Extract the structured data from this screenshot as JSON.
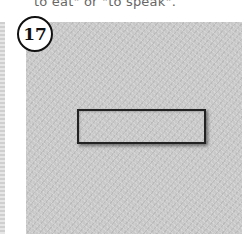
{
  "caption": "to eat\" or \"to speak\".",
  "step": {
    "number": "17"
  },
  "illustration": {
    "description": "textured gray panel with a rectangular outline drawn near the center",
    "colors": {
      "panel": "#c8c8c8",
      "outline": "#222222",
      "badge_border": "#111111"
    }
  }
}
